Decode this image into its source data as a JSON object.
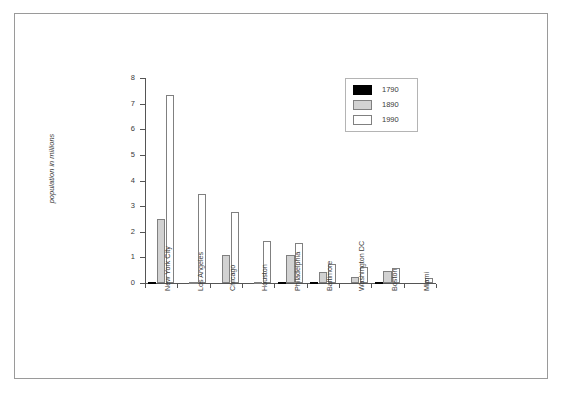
{
  "chart_data": {
    "type": "bar",
    "title": "",
    "xlabel": "",
    "ylabel": "population in millions",
    "ylim": [
      0,
      8
    ],
    "yticks": [
      0,
      1,
      2,
      3,
      4,
      5,
      6,
      7,
      8
    ],
    "ytick_labels": [
      "0",
      "1",
      "2",
      "3",
      "4",
      "5",
      "6",
      "7",
      "8"
    ],
    "grid": false,
    "legend_position": "top-right",
    "categories": [
      "New York City",
      "Los Angeles",
      "Chicago",
      "Houston",
      "Philadelphia",
      "Baltimore",
      "Washington DC",
      "Boston",
      "Miami"
    ],
    "series": [
      {
        "name": "1790",
        "color": "#000000",
        "values": [
          0.03,
          0.0,
          0.0,
          0.0,
          0.03,
          0.01,
          0.0,
          0.02,
          0.0
        ]
      },
      {
        "name": "1890",
        "color": "#d2d2d2",
        "values": [
          2.51,
          0.05,
          1.1,
          0.03,
          1.1,
          0.43,
          0.23,
          0.45,
          0.0
        ]
      },
      {
        "name": "1990",
        "color": "#ffffff",
        "values": [
          7.32,
          3.49,
          2.78,
          1.63,
          1.58,
          0.74,
          0.61,
          0.57,
          0.18
        ]
      }
    ]
  },
  "legend": {
    "entries": [
      {
        "label": "1790"
      },
      {
        "label": "1890"
      },
      {
        "label": "1990"
      }
    ]
  },
  "colors": {
    "axis": "#555555",
    "text": "#3a3a3a",
    "frame": "#9a9a9a",
    "bar_outline": "#808080"
  }
}
